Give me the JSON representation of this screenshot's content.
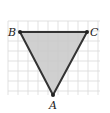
{
  "diagram": {
    "type": "triangle-on-grid",
    "grid": {
      "x0": 8,
      "y0": 21,
      "x1": 100,
      "y1": 95,
      "cell": 10,
      "color": "#d9d9d9"
    },
    "triangle": {
      "fill": "#c8c8c8",
      "stroke": "#333333",
      "vertices": [
        {
          "name": "B",
          "x": 20,
          "y": 32,
          "label_x": 8,
          "label_y": 36
        },
        {
          "name": "C",
          "x": 87,
          "y": 32,
          "label_x": 90,
          "label_y": 36
        },
        {
          "name": "A",
          "x": 53,
          "y": 95,
          "label_x": 49,
          "label_y": 109
        }
      ]
    },
    "labels": {
      "A": "A",
      "B": "B",
      "C": "C"
    }
  }
}
